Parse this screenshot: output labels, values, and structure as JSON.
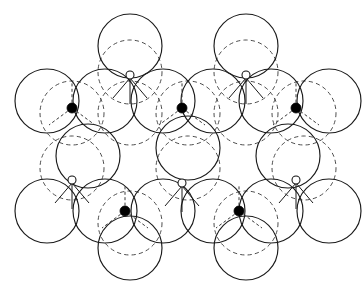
{
  "figure": {
    "canvas": {
      "width": 364,
      "height": 286,
      "background": "#ffffff"
    },
    "geometry": {
      "sphere_radius": 32,
      "row_pitch_x": 64,
      "row_pitch_y": 55,
      "layer_b_offset_x": 0,
      "layer_b_offset_y": 12
    },
    "legend_colors": {
      "layer_a_stroke": "#1a1a1a",
      "layer_b_stroke": "#4d4d4d",
      "filled_site_fill": "#000000",
      "open_site_fill": "#ffffff",
      "open_site_stroke": "#111111"
    },
    "layer_a": {
      "name": "layer-a-solid-spheres",
      "style": "solid",
      "count": 21,
      "centers": [
        [
          130,
          46
        ],
        [
          246,
          46
        ],
        [
          47,
          101
        ],
        [
          105,
          101
        ],
        [
          163,
          101
        ],
        [
          188,
          101
        ],
        [
          246,
          101
        ],
        [
          271,
          101
        ],
        [
          329,
          101
        ],
        [
          88,
          156
        ],
        [
          188,
          156
        ],
        [
          288,
          156
        ],
        [
          47,
          211
        ],
        [
          105,
          211
        ],
        [
          163,
          211
        ],
        [
          188,
          211
        ],
        [
          246,
          211
        ],
        [
          271,
          211
        ],
        [
          329,
          211
        ],
        [
          130,
          248
        ],
        [
          246,
          248
        ]
      ]
    },
    "layer_b": {
      "name": "layer-b-dashed-spheres",
      "style": "dashed",
      "count": 12,
      "centers": [
        [
          130,
          72
        ],
        [
          246,
          72
        ],
        [
          72,
          113
        ],
        [
          130,
          113
        ],
        [
          246,
          113
        ],
        [
          304,
          113
        ],
        [
          188,
          168
        ],
        [
          72,
          168
        ],
        [
          304,
          168
        ],
        [
          130,
          223
        ],
        [
          246,
          223
        ],
        [
          188,
          113
        ]
      ]
    },
    "octahedral_sites": {
      "name": "filled-interstitial-sites",
      "marker": "filled-dot",
      "count": 6,
      "radius": 5,
      "centers": [
        [
          72,
          108
        ],
        [
          182,
          108
        ],
        [
          296,
          108
        ],
        [
          125,
          211
        ],
        [
          239,
          211
        ],
        [
          182,
          238
        ]
      ]
    },
    "tetrahedral_sites": {
      "name": "open-interstitial-sites",
      "marker": "open-dot",
      "count": 6,
      "radius": 4,
      "centers": [
        [
          130,
          75
        ],
        [
          246,
          75
        ],
        [
          72,
          180
        ],
        [
          182,
          183
        ],
        [
          296,
          180
        ],
        [
          188,
          131
        ]
      ]
    }
  }
}
